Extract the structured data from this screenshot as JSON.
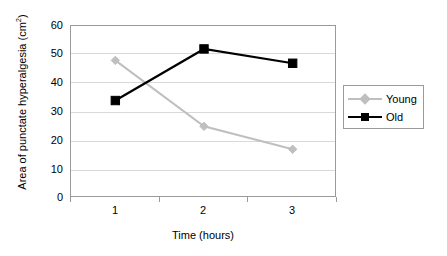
{
  "chart_data": {
    "type": "line",
    "title": "",
    "xlabel": "Time (hours)",
    "ylabel": "Area of punctate hyperalgesia (cm2)",
    "ylabel_base": "Area of punctate hyperalgesia (cm",
    "ylabel_sup": "2",
    "ylabel_tail": ")",
    "categories": [
      "1",
      "2",
      "3"
    ],
    "x": [
      1,
      2,
      3
    ],
    "ylim": [
      0,
      60
    ],
    "xlim": [
      0.5,
      3.5
    ],
    "ytick_labels": [
      "60",
      "50",
      "40",
      "30",
      "20",
      "10",
      "0"
    ],
    "ytick_values": [
      60,
      50,
      40,
      30,
      20,
      10,
      0
    ],
    "xtick_labels": [
      "1",
      "2",
      "3"
    ],
    "grid": "horizontal",
    "grid_color": "#d9d9d9",
    "legend_position": "right",
    "frame_color": "#9a9a9a",
    "background": "#ffffff",
    "series": [
      {
        "name": "Young",
        "values": [
          48,
          25,
          17
        ],
        "color": "#bfbfbf",
        "marker": "diamond"
      },
      {
        "name": "Old",
        "values": [
          34,
          52,
          47
        ],
        "color": "#000000",
        "marker": "square"
      }
    ]
  },
  "legend": {
    "items": [
      {
        "label": "Young",
        "color": "#bfbfbf",
        "marker": "diamond"
      },
      {
        "label": "Old",
        "color": "#000000",
        "marker": "square"
      }
    ]
  }
}
